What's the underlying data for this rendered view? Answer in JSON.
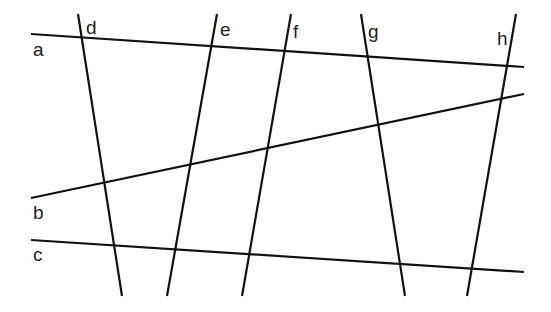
{
  "diagram": {
    "line_color": "#111111",
    "label_color": "#222222",
    "horizontal_lines": [
      {
        "id": "a",
        "label": "a"
      },
      {
        "id": "b",
        "label": "b"
      },
      {
        "id": "c",
        "label": "c"
      }
    ],
    "vertical_lines": [
      {
        "id": "d",
        "label": "d"
      },
      {
        "id": "e",
        "label": "e"
      },
      {
        "id": "f",
        "label": "f"
      },
      {
        "id": "g",
        "label": "g"
      },
      {
        "id": "h",
        "label": "h"
      }
    ]
  }
}
